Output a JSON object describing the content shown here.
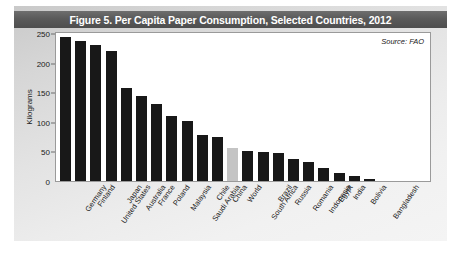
{
  "figure": {
    "title": "Figure 5. Per Capita Paper Consumption, Selected Countries, 2012",
    "source_note": "Source: FAO",
    "panel_color": "#e2e2e2",
    "title_band_color": "#5a5a5a",
    "bar_color": "#181818",
    "highlight_bar_color": "#c4c4c4"
  },
  "chart_data": {
    "type": "bar",
    "title": "Figure 5. Per Capita Paper Consumption, Selected Countries, 2012",
    "xlabel": "",
    "ylabel": "Kilograms",
    "ylim": [
      0,
      250
    ],
    "yticks": [
      0,
      50,
      100,
      150,
      200,
      250
    ],
    "ytick_labels": [
      "0",
      "50",
      "100",
      "150",
      "200",
      "250"
    ],
    "grid": false,
    "legend": null,
    "annotations": [
      "Source: FAO"
    ],
    "highlight_category": "World",
    "categories": [
      "Germany",
      "Finland",
      "United States",
      "Japan",
      "Australia",
      "France",
      "Poland",
      "Malaysia",
      "Saudi Arabia",
      "Chile",
      "China",
      "World",
      "South Africa",
      "Brazil",
      "Russia",
      "Romania",
      "Indonesia",
      "Egypt",
      "India",
      "Bolivia",
      "Bangladesh"
    ],
    "values": [
      243,
      237,
      230,
      219,
      157,
      143,
      130,
      110,
      101,
      78,
      75,
      56,
      50,
      49,
      47,
      38,
      32,
      22,
      13,
      9,
      4
    ]
  }
}
